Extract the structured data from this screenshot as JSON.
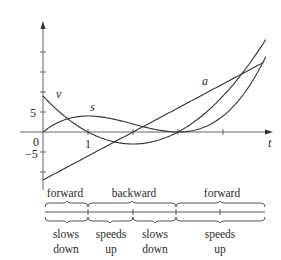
{
  "chart_data": {
    "type": "line",
    "title": "",
    "xlabel": "t",
    "ylabel": "",
    "xlim": [
      0,
      5
    ],
    "ylim": [
      -13,
      24
    ],
    "grid": false,
    "x_ticks": [
      0,
      1,
      2,
      3,
      4
    ],
    "x_tick_labels": {
      "0": "0",
      "1": "1"
    },
    "y_ticks": [
      -10,
      -5,
      5,
      10,
      15,
      20
    ],
    "y_tick_labels": {
      "5": "5",
      "-5": "−5"
    },
    "origin_label": "0",
    "series": [
      {
        "name": "s",
        "formula": "t^3 - 6t^2 + 9t",
        "t_range": [
          0,
          4.95
        ]
      },
      {
        "name": "v",
        "formula": "3t^2 - 12t + 9",
        "t_range": [
          0,
          4.95
        ]
      },
      {
        "name": "a",
        "formula": "6t - 12",
        "t_range": [
          0,
          4.9
        ]
      }
    ],
    "annotations": {
      "motion_direction": [
        {
          "interval": [
            0,
            1
          ],
          "label": "forward"
        },
        {
          "interval": [
            1,
            3
          ],
          "label": "backward"
        },
        {
          "interval": [
            3,
            5
          ],
          "label": "forward"
        }
      ],
      "speed_change": [
        {
          "interval": [
            0,
            1
          ],
          "label": [
            "slows",
            "down"
          ]
        },
        {
          "interval": [
            1,
            2
          ],
          "label": [
            "speeds",
            "up"
          ]
        },
        {
          "interval": [
            2,
            3
          ],
          "label": [
            "slows",
            "down"
          ]
        },
        {
          "interval": [
            3,
            5
          ],
          "label": [
            "speeds",
            "up"
          ]
        }
      ]
    }
  },
  "labels": {
    "s": "s",
    "v": "v",
    "a": "a",
    "t": "t",
    "y5": "5",
    "yneg5": "−5",
    "origin": "0",
    "x1": "1"
  },
  "direction_labels": [
    "forward",
    "backward",
    "forward"
  ],
  "speed_labels": [
    {
      "line1": "slows",
      "line2": "down"
    },
    {
      "line1": "speeds",
      "line2": "up"
    },
    {
      "line1": "slows",
      "line2": "down"
    },
    {
      "line1": "speeds",
      "line2": "up"
    }
  ],
  "colors": {
    "ink": "#2a2a2a",
    "axis": "#555555"
  }
}
